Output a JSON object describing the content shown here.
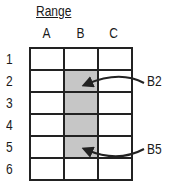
{
  "title": "Range",
  "columns": [
    "A",
    "B",
    "C"
  ],
  "rows": [
    "1",
    "2",
    "3",
    "4",
    "5",
    "6"
  ],
  "selected_range": {
    "column": "B",
    "start_row": 2,
    "end_row": 5
  },
  "annotations": [
    {
      "label": "B2",
      "points_to": "B2"
    },
    {
      "label": "B5",
      "points_to": "B5"
    }
  ],
  "colors": {
    "selection": "#c6c6c6",
    "grid": "#222222"
  }
}
